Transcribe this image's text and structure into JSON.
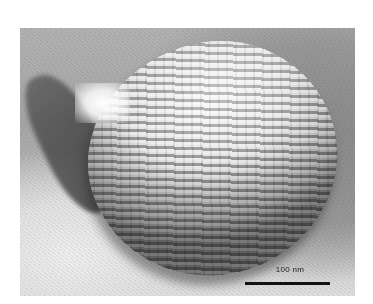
{
  "image": {
    "type": "electron micrograph",
    "subject": "ovoid cell with regular striated surface pattern",
    "palette": {
      "background": "#ffffff",
      "frame_mid": "#a8a8a8",
      "cell_highlight": "#f4f4f4",
      "cell_shadow": "#6e6e6e",
      "scale_bar": "#111111"
    }
  },
  "scale_bar": {
    "label": "100 nm"
  }
}
